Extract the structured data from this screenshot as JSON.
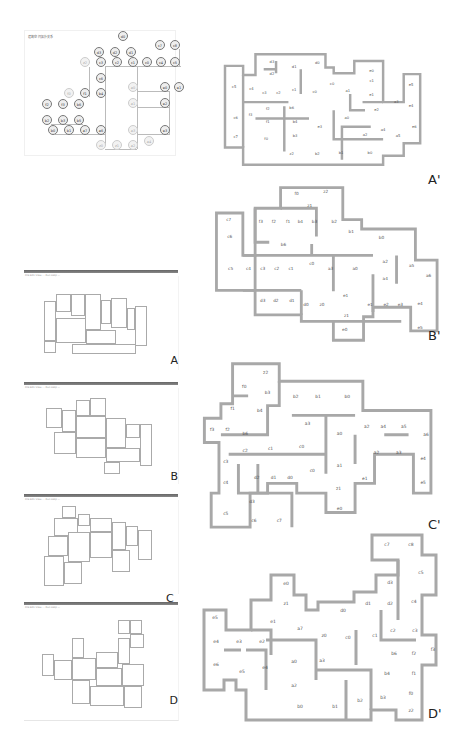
{
  "figure": {
    "graph": {
      "title": "建筑空间拓扑关系",
      "nodes": [
        {
          "id": "d0",
          "x": 98,
          "y": 5,
          "light": false
        },
        {
          "id": "d3",
          "x": 74,
          "y": 21,
          "light": false
        },
        {
          "id": "d2",
          "x": 90,
          "y": 21,
          "light": false
        },
        {
          "id": "d1",
          "x": 106,
          "y": 21,
          "light": false
        },
        {
          "id": "c7",
          "x": 135,
          "y": 14,
          "light": false
        },
        {
          "id": "c8",
          "x": 150,
          "y": 14,
          "light": false
        },
        {
          "id": "z2",
          "x": 60,
          "y": 31,
          "light": true
        },
        {
          "id": "c3",
          "x": 76,
          "y": 31,
          "light": false
        },
        {
          "id": "c2",
          "x": 92,
          "y": 31,
          "light": false
        },
        {
          "id": "c1",
          "x": 108,
          "y": 31,
          "light": false
        },
        {
          "id": "c0",
          "x": 122,
          "y": 31,
          "light": false
        },
        {
          "id": "c4",
          "x": 136,
          "y": 31,
          "light": false
        },
        {
          "id": "c5",
          "x": 150,
          "y": 31,
          "light": false
        },
        {
          "id": "c6",
          "x": 76,
          "y": 47,
          "light": false
        },
        {
          "id": "f0",
          "x": 44,
          "y": 62,
          "light": true
        },
        {
          "id": "f1",
          "x": 60,
          "y": 62,
          "light": false
        },
        {
          "id": "b4",
          "x": 76,
          "y": 62,
          "light": false
        },
        {
          "id": "a0",
          "x": 108,
          "y": 56,
          "light": true
        },
        {
          "id": "e0",
          "x": 140,
          "y": 56,
          "light": false
        },
        {
          "id": "e1",
          "x": 154,
          "y": 56,
          "light": false
        },
        {
          "id": "f2",
          "x": 22,
          "y": 73,
          "light": false
        },
        {
          "id": "f3",
          "x": 38,
          "y": 73,
          "light": false
        },
        {
          "id": "b6",
          "x": 54,
          "y": 73,
          "light": false
        },
        {
          "id": "a1",
          "x": 108,
          "y": 72,
          "light": true
        },
        {
          "id": "e2",
          "x": 140,
          "y": 72,
          "light": false
        },
        {
          "id": "b2",
          "x": 22,
          "y": 89,
          "light": false
        },
        {
          "id": "b3",
          "x": 38,
          "y": 89,
          "light": false
        },
        {
          "id": "b5",
          "x": 54,
          "y": 89,
          "light": false
        },
        {
          "id": "b0",
          "x": 28,
          "y": 99,
          "light": false
        },
        {
          "id": "b1",
          "x": 44,
          "y": 99,
          "light": false
        },
        {
          "id": "a7",
          "x": 60,
          "y": 99,
          "light": false
        },
        {
          "id": "a6",
          "x": 76,
          "y": 99,
          "light": false
        },
        {
          "id": "a3",
          "x": 108,
          "y": 99,
          "light": true
        },
        {
          "id": "e3",
          "x": 140,
          "y": 99,
          "light": false
        },
        {
          "id": "a4",
          "x": 124,
          "y": 110,
          "light": true
        },
        {
          "id": "z0",
          "x": 76,
          "y": 114,
          "light": true
        },
        {
          "id": "z1",
          "x": 92,
          "y": 114,
          "light": true
        },
        {
          "id": "a2",
          "x": 108,
          "y": 114,
          "light": true
        }
      ]
    },
    "screenshots": [
      {
        "label": "A",
        "subtitle": "File  Edit  View   ...   Run   Help  —"
      },
      {
        "label": "B",
        "subtitle": "File  Edit  View   ...   Run   Help  —"
      },
      {
        "label": "C",
        "subtitle": "File  Edit  View   ...   Run   Help  —"
      },
      {
        "label": "D",
        "subtitle": "File  Edit  View   ...   Run   Help  —"
      }
    ],
    "plans": [
      {
        "label": "A'",
        "rooms": [
          {
            "t": "d3",
            "x": 65,
            "y": 42
          },
          {
            "t": "d1",
            "x": 92,
            "y": 49
          },
          {
            "t": "d0",
            "x": 120,
            "y": 44
          },
          {
            "t": "d2",
            "x": 65,
            "y": 57
          },
          {
            "t": "e0",
            "x": 186,
            "y": 54
          },
          {
            "t": "c5",
            "x": 19,
            "y": 73
          },
          {
            "t": "c4",
            "x": 40,
            "y": 75
          },
          {
            "t": "c0",
            "x": 138,
            "y": 69
          },
          {
            "t": "c1",
            "x": 186,
            "y": 66
          },
          {
            "t": "e5",
            "x": 234,
            "y": 70
          },
          {
            "t": "c3",
            "x": 56,
            "y": 80
          },
          {
            "t": "c2",
            "x": 73,
            "y": 80
          },
          {
            "t": "c1",
            "x": 92,
            "y": 77
          },
          {
            "t": "c0",
            "x": 117,
            "y": 79
          },
          {
            "t": "a1",
            "x": 157,
            "y": 78
          },
          {
            "t": "e1",
            "x": 186,
            "y": 83
          },
          {
            "t": "a3",
            "x": 216,
            "y": 91
          },
          {
            "t": "e4",
            "x": 234,
            "y": 96
          },
          {
            "t": "f2",
            "x": 60,
            "y": 99
          },
          {
            "t": "b6",
            "x": 89,
            "y": 98
          },
          {
            "t": "e2",
            "x": 192,
            "y": 101
          },
          {
            "t": "c6",
            "x": 21,
            "y": 110
          },
          {
            "t": "f3",
            "x": 39,
            "y": 107
          },
          {
            "t": "a0",
            "x": 156,
            "y": 111
          },
          {
            "t": "f1",
            "x": 60,
            "y": 115
          },
          {
            "t": "b4",
            "x": 93,
            "y": 115
          },
          {
            "t": "e3",
            "x": 123,
            "y": 122
          },
          {
            "t": "a4",
            "x": 200,
            "y": 125
          },
          {
            "t": "e6",
            "x": 238,
            "y": 122
          },
          {
            "t": "c7",
            "x": 21,
            "y": 134
          },
          {
            "t": "b3",
            "x": 93,
            "y": 132
          },
          {
            "t": "a2",
            "x": 178,
            "y": 131
          },
          {
            "t": "a5",
            "x": 218,
            "y": 132
          },
          {
            "t": "f0",
            "x": 58,
            "y": 136
          },
          {
            "t": "z2",
            "x": 89,
            "y": 154
          },
          {
            "t": "b2",
            "x": 120,
            "y": 154
          },
          {
            "t": "b1",
            "x": 149,
            "y": 153
          },
          {
            "t": "b0",
            "x": 184,
            "y": 153
          }
        ]
      },
      {
        "label": "B'",
        "rooms": [
          {
            "t": "f0",
            "x": 99,
            "y": 16
          },
          {
            "t": "z2",
            "x": 130,
            "y": 14
          },
          {
            "t": "z1",
            "x": 113,
            "y": 29
          },
          {
            "t": "c7",
            "x": 27,
            "y": 43
          },
          {
            "t": "f3",
            "x": 61,
            "y": 46
          },
          {
            "t": "f2",
            "x": 75,
            "y": 46
          },
          {
            "t": "f1",
            "x": 90,
            "y": 46
          },
          {
            "t": "b4",
            "x": 103,
            "y": 46
          },
          {
            "t": "b3",
            "x": 118,
            "y": 46
          },
          {
            "t": "b2",
            "x": 139,
            "y": 46
          },
          {
            "t": "c6",
            "x": 28,
            "y": 61
          },
          {
            "t": "b1",
            "x": 157,
            "y": 56
          },
          {
            "t": "b0",
            "x": 189,
            "y": 63
          },
          {
            "t": "b6",
            "x": 85,
            "y": 70
          },
          {
            "t": "c5",
            "x": 29,
            "y": 96
          },
          {
            "t": "c4",
            "x": 48,
            "y": 96
          },
          {
            "t": "c3",
            "x": 63,
            "y": 96
          },
          {
            "t": "c2",
            "x": 78,
            "y": 96
          },
          {
            "t": "c1",
            "x": 93,
            "y": 96
          },
          {
            "t": "c0",
            "x": 115,
            "y": 90
          },
          {
            "t": "a3",
            "x": 135,
            "y": 96
          },
          {
            "t": "a0",
            "x": 161,
            "y": 96
          },
          {
            "t": "a2",
            "x": 193,
            "y": 88
          },
          {
            "t": "a5",
            "x": 221,
            "y": 92
          },
          {
            "t": "a6",
            "x": 239,
            "y": 103
          },
          {
            "t": "a4",
            "x": 193,
            "y": 106
          },
          {
            "t": "d3",
            "x": 63,
            "y": 129
          },
          {
            "t": "d2",
            "x": 77,
            "y": 129
          },
          {
            "t": "d1",
            "x": 94,
            "y": 129
          },
          {
            "t": "e1",
            "x": 151,
            "y": 124
          },
          {
            "t": "d0",
            "x": 109,
            "y": 134
          },
          {
            "t": "z0",
            "x": 126,
            "y": 134
          },
          {
            "t": "e1",
            "x": 177,
            "y": 134
          },
          {
            "t": "e2",
            "x": 194,
            "y": 134
          },
          {
            "t": "e3",
            "x": 209,
            "y": 134
          },
          {
            "t": "e4",
            "x": 230,
            "y": 133
          },
          {
            "t": "z1",
            "x": 152,
            "y": 145
          },
          {
            "t": "e0",
            "x": 150,
            "y": 160
          },
          {
            "t": "e5",
            "x": 230,
            "y": 158
          }
        ]
      },
      {
        "label": "C'",
        "rooms": [
          {
            "t": "z2",
            "x": 68,
            "y": 17
          },
          {
            "t": "f0",
            "x": 46,
            "y": 32
          },
          {
            "t": "b3",
            "x": 70,
            "y": 38
          },
          {
            "t": "b2",
            "x": 99,
            "y": 42
          },
          {
            "t": "b1",
            "x": 122,
            "y": 42
          },
          {
            "t": "b0",
            "x": 152,
            "y": 42
          },
          {
            "t": "f1",
            "x": 34,
            "y": 54
          },
          {
            "t": "b4",
            "x": 62,
            "y": 57
          },
          {
            "t": "f3",
            "x": 13,
            "y": 76
          },
          {
            "t": "f2",
            "x": 29,
            "y": 76
          },
          {
            "t": "b6",
            "x": 47,
            "y": 80
          },
          {
            "t": "a3",
            "x": 111,
            "y": 70
          },
          {
            "t": "a0",
            "x": 144,
            "y": 80
          },
          {
            "t": "a2",
            "x": 172,
            "y": 73
          },
          {
            "t": "a4",
            "x": 189,
            "y": 73
          },
          {
            "t": "a5",
            "x": 210,
            "y": 73
          },
          {
            "t": "a6",
            "x": 233,
            "y": 81
          },
          {
            "t": "c2",
            "x": 47,
            "y": 98
          },
          {
            "t": "c1",
            "x": 73,
            "y": 96
          },
          {
            "t": "c0",
            "x": 105,
            "y": 94
          },
          {
            "t": "a2",
            "x": 182,
            "y": 100
          },
          {
            "t": "a3",
            "x": 205,
            "y": 100
          },
          {
            "t": "c3",
            "x": 27,
            "y": 109
          },
          {
            "t": "e4",
            "x": 230,
            "y": 106
          },
          {
            "t": "a1",
            "x": 144,
            "y": 113
          },
          {
            "t": "c0",
            "x": 116,
            "y": 118
          },
          {
            "t": "d2",
            "x": 59,
            "y": 125
          },
          {
            "t": "d1",
            "x": 76,
            "y": 125
          },
          {
            "t": "d0",
            "x": 93,
            "y": 125
          },
          {
            "t": "e1",
            "x": 170,
            "y": 126
          },
          {
            "t": "c4",
            "x": 27,
            "y": 131
          },
          {
            "t": "e5",
            "x": 230,
            "y": 131
          },
          {
            "t": "z1",
            "x": 143,
            "y": 137
          },
          {
            "t": "d3",
            "x": 54,
            "y": 150
          },
          {
            "t": "e0",
            "x": 144,
            "y": 157
          },
          {
            "t": "c5",
            "x": 27,
            "y": 162
          },
          {
            "t": "c6",
            "x": 56,
            "y": 170
          },
          {
            "t": "c7",
            "x": 82,
            "y": 170
          }
        ]
      },
      {
        "label": "D'",
        "rooms": [
          {
            "t": "c7",
            "x": 191,
            "y": 16
          },
          {
            "t": "c8",
            "x": 215,
            "y": 16
          },
          {
            "t": "c5",
            "x": 225,
            "y": 44
          },
          {
            "t": "d3",
            "x": 194,
            "y": 54
          },
          {
            "t": "e0",
            "x": 90,
            "y": 55
          },
          {
            "t": "z1",
            "x": 90,
            "y": 75
          },
          {
            "t": "d1",
            "x": 172,
            "y": 75
          },
          {
            "t": "d2",
            "x": 194,
            "y": 75
          },
          {
            "t": "c4",
            "x": 218,
            "y": 73
          },
          {
            "t": "d0",
            "x": 147,
            "y": 82
          },
          {
            "t": "e5",
            "x": 19,
            "y": 89
          },
          {
            "t": "e1",
            "x": 77,
            "y": 93
          },
          {
            "t": "a7",
            "x": 104,
            "y": 100
          },
          {
            "t": "c2",
            "x": 197,
            "y": 102
          },
          {
            "t": "c3",
            "x": 219,
            "y": 102
          },
          {
            "t": "e4",
            "x": 20,
            "y": 113
          },
          {
            "t": "e3",
            "x": 43,
            "y": 113
          },
          {
            "t": "e2",
            "x": 66,
            "y": 113
          },
          {
            "t": "z0",
            "x": 128,
            "y": 107
          },
          {
            "t": "c0",
            "x": 152,
            "y": 109
          },
          {
            "t": "c1",
            "x": 179,
            "y": 107
          },
          {
            "t": "f3",
            "x": 237,
            "y": 121
          },
          {
            "t": "b6",
            "x": 198,
            "y": 125
          },
          {
            "t": "f2",
            "x": 218,
            "y": 125
          },
          {
            "t": "e6",
            "x": 20,
            "y": 136
          },
          {
            "t": "e5",
            "x": 46,
            "y": 143
          },
          {
            "t": "e4",
            "x": 69,
            "y": 139
          },
          {
            "t": "a0",
            "x": 98,
            "y": 133
          },
          {
            "t": "a3",
            "x": 126,
            "y": 132
          },
          {
            "t": "b4",
            "x": 191,
            "y": 145
          },
          {
            "t": "f1",
            "x": 218,
            "y": 145
          },
          {
            "t": "a2",
            "x": 98,
            "y": 157
          },
          {
            "t": "f0",
            "x": 215,
            "y": 165
          },
          {
            "t": "b2",
            "x": 164,
            "y": 172
          },
          {
            "t": "b3",
            "x": 187,
            "y": 169
          },
          {
            "t": "b0",
            "x": 104,
            "y": 178
          },
          {
            "t": "b1",
            "x": 139,
            "y": 178
          },
          {
            "t": "z2",
            "x": 215,
            "y": 182
          }
        ]
      }
    ]
  }
}
